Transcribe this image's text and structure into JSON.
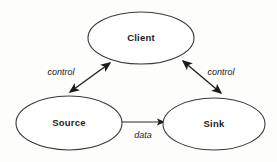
{
  "diagram": {
    "background_color": "#fdfdfc",
    "node_fill": "#ffffff",
    "node_stroke": "#3a3a3a",
    "edge_color": "#262626",
    "label_color": "#1d1d1d",
    "nodes": [
      {
        "id": "client",
        "label": "Client",
        "shape": "ellipse",
        "cx": 141,
        "cy": 38,
        "rx": 53,
        "ry": 26
      },
      {
        "id": "source",
        "label": "Source",
        "shape": "ellipse",
        "cx": 69,
        "cy": 123,
        "rx": 53,
        "ry": 27
      },
      {
        "id": "sink",
        "label": "Sink",
        "shape": "ellipse",
        "cx": 214,
        "cy": 124,
        "rx": 51,
        "ry": 26
      }
    ],
    "edges": [
      {
        "id": "source-client",
        "label": "control",
        "from": "source",
        "to": "client",
        "arrow": "double",
        "label_x": 61,
        "label_y": 73
      },
      {
        "id": "client-sink",
        "label": "control",
        "from": "client",
        "to": "sink",
        "arrow": "double",
        "label_x": 221,
        "label_y": 73
      },
      {
        "id": "source-sink",
        "label": "data",
        "from": "source",
        "to": "sink",
        "arrow": "single",
        "label_x": 143,
        "label_y": 136
      }
    ]
  }
}
